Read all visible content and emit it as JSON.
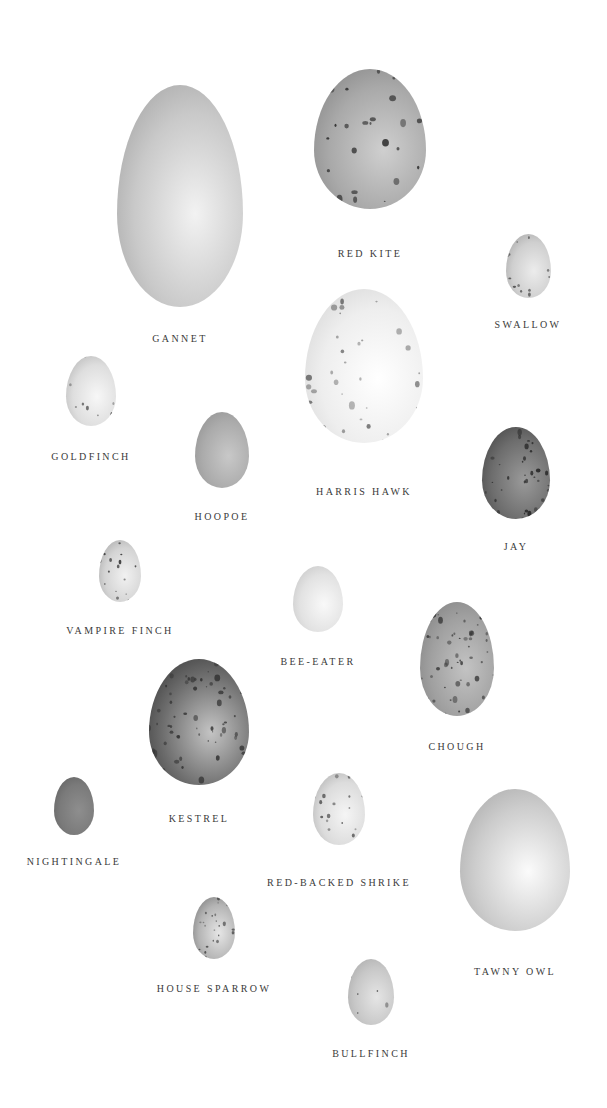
{
  "plate": {
    "title": "",
    "eggs": [
      {
        "id": "gannet",
        "label": "GANNET",
        "cx": 180,
        "cy": 196,
        "w": 126,
        "h": 222,
        "base": "#c9c9c9",
        "light": "#f2f2f2",
        "shade": "#9a9a9a",
        "spots": 0,
        "spot_color": "#555",
        "label_y": 333
      },
      {
        "id": "red-kite",
        "label": "RED KITE",
        "cx": 370,
        "cy": 139,
        "w": 112,
        "h": 140,
        "base": "#a9a9a9",
        "light": "#cfcfcf",
        "shade": "#7d7d7d",
        "spots": 30,
        "spot_color": "#2b2b2b",
        "label_y": 248
      },
      {
        "id": "swallow",
        "label": "SWALLOW",
        "cx": 528,
        "cy": 266,
        "w": 45,
        "h": 64,
        "base": "#cfcfcf",
        "light": "#ececec",
        "shade": "#9a9a9a",
        "spots": 14,
        "spot_color": "#444",
        "label_y": 319
      },
      {
        "id": "goldfinch",
        "label": "GOLDFINCH",
        "cx": 91,
        "cy": 391,
        "w": 50,
        "h": 70,
        "base": "#dedede",
        "light": "#f7f7f7",
        "shade": "#aaaaaa",
        "spots": 10,
        "spot_color": "#555",
        "label_y": 451
      },
      {
        "id": "hoopoe",
        "label": "HOOPOE",
        "cx": 222,
        "cy": 450,
        "w": 54,
        "h": 76,
        "base": "#ababab",
        "light": "#c8c8c8",
        "shade": "#8a8a8a",
        "spots": 0,
        "spot_color": "#555",
        "label_y": 511
      },
      {
        "id": "harris-hawk",
        "label": "HARRIS HAWK",
        "cx": 364,
        "cy": 366,
        "w": 118,
        "h": 154,
        "base": "#eeeeee",
        "light": "#ffffff",
        "shade": "#cfcfcf",
        "spots": 40,
        "spot_color": "#6a6a6a",
        "label_y": 486
      },
      {
        "id": "jay",
        "label": "JAY",
        "cx": 516,
        "cy": 473,
        "w": 68,
        "h": 92,
        "base": "#6d6d6d",
        "light": "#9a9a9a",
        "shade": "#3a3a3a",
        "spots": 45,
        "spot_color": "#262626",
        "label_y": 541
      },
      {
        "id": "vampire-finch",
        "label": "VAMPIRE FINCH",
        "cx": 120,
        "cy": 571,
        "w": 42,
        "h": 62,
        "base": "#d4d4d4",
        "light": "#f1f1f1",
        "shade": "#9c9c9c",
        "spots": 18,
        "spot_color": "#2f2f2f",
        "label_y": 625
      },
      {
        "id": "bee-eater",
        "label": "BEE-EATER",
        "cx": 318,
        "cy": 599,
        "w": 50,
        "h": 66,
        "base": "#e2e2e2",
        "light": "#f9f9f9",
        "shade": "#bdbdbd",
        "spots": 0,
        "spot_color": "#555",
        "label_y": 656
      },
      {
        "id": "chough",
        "label": "CHOUGH",
        "cx": 457,
        "cy": 659,
        "w": 74,
        "h": 114,
        "base": "#a0a0a0",
        "light": "#c3c3c3",
        "shade": "#7a7a7a",
        "spots": 60,
        "spot_color": "#3a3a3a",
        "label_y": 741
      },
      {
        "id": "kestrel",
        "label": "KESTREL",
        "cx": 199,
        "cy": 722,
        "w": 100,
        "h": 126,
        "base": "#6e6e6e",
        "light": "#c4c4c4",
        "shade": "#2e2e2e",
        "spots": 70,
        "spot_color": "#333",
        "label_y": 813
      },
      {
        "id": "nightingale",
        "label": "NIGHTINGALE",
        "cx": 74,
        "cy": 806,
        "w": 40,
        "h": 58,
        "base": "#7a7a7a",
        "light": "#8e8e8e",
        "shade": "#5a5a5a",
        "spots": 0,
        "spot_color": "#444",
        "label_y": 856
      },
      {
        "id": "red-backed-shrike",
        "label": "RED-BACKED SHRIKE",
        "cx": 339,
        "cy": 809,
        "w": 52,
        "h": 72,
        "base": "#dcdcdc",
        "light": "#f5f5f5",
        "shade": "#a3a3a3",
        "spots": 22,
        "spot_color": "#545454",
        "label_y": 877
      },
      {
        "id": "tawny-owl",
        "label": "TAWNY OWL",
        "cx": 515,
        "cy": 860,
        "w": 110,
        "h": 142,
        "base": "#cdcdcd",
        "light": "#fbfbfb",
        "shade": "#a0a0a0",
        "spots": 0,
        "spot_color": "#555",
        "label_y": 966
      },
      {
        "id": "house-sparrow",
        "label": "HOUSE SPARROW",
        "cx": 214,
        "cy": 928,
        "w": 42,
        "h": 62,
        "base": "#b4b4b4",
        "light": "#e6e6e6",
        "shade": "#6a6a6a",
        "spots": 24,
        "spot_color": "#4a4a4a",
        "label_y": 983
      },
      {
        "id": "bullfinch",
        "label": "BULLFINCH",
        "cx": 371,
        "cy": 992,
        "w": 46,
        "h": 66,
        "base": "#c7c7c7",
        "light": "#e5e5e5",
        "shade": "#a2a2a2",
        "spots": 8,
        "spot_color": "#444",
        "label_y": 1048
      }
    ]
  }
}
